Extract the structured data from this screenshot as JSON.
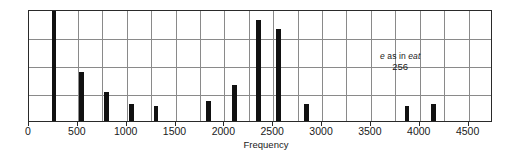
{
  "chart_data": {
    "type": "bar",
    "title": "",
    "subtitle": "",
    "xlabel": "Frequency",
    "ylabel": "",
    "xlim": [
      0,
      4750
    ],
    "ylim": [
      0,
      4
    ],
    "grid": true,
    "legend": null,
    "xticks": [
      0,
      500,
      1000,
      1500,
      2000,
      2500,
      3000,
      3500,
      4000,
      4500
    ],
    "xticklabels": [
      "0",
      "500",
      "1000",
      "1500",
      "2000",
      "2500",
      "3000",
      "3500",
      "4000",
      "4500"
    ],
    "yticks": [
      0,
      1,
      2,
      3,
      4
    ],
    "yticklabels": [
      "",
      "",
      "",
      "",
      ""
    ],
    "x": [
      256,
      540,
      790,
      1050,
      1300,
      1840,
      2100,
      2350,
      2550,
      2840,
      3870,
      4140
    ],
    "values": [
      4.0,
      1.75,
      1.05,
      0.62,
      0.55,
      0.72,
      1.3,
      3.6,
      3.3,
      0.6,
      0.55,
      0.6
    ],
    "bar_width_hz": 50,
    "bars": [
      {
        "name": "bar-256",
        "freq": 256,
        "height": 4.0
      },
      {
        "name": "bar-540",
        "freq": 540,
        "height": 1.75
      },
      {
        "name": "bar-790",
        "freq": 790,
        "height": 1.05
      },
      {
        "name": "bar-1050",
        "freq": 1050,
        "height": 0.62
      },
      {
        "name": "bar-1300",
        "freq": 1300,
        "height": 0.55
      },
      {
        "name": "bar-1840",
        "freq": 1840,
        "height": 0.72
      },
      {
        "name": "bar-2100",
        "freq": 2100,
        "height": 1.3
      },
      {
        "name": "bar-2350",
        "freq": 2350,
        "height": 3.6
      },
      {
        "name": "bar-2550",
        "freq": 2550,
        "height": 3.3
      },
      {
        "name": "bar-2840",
        "freq": 2840,
        "height": 0.6
      },
      {
        "name": "bar-3870",
        "freq": 3870,
        "height": 0.55
      },
      {
        "name": "bar-4140",
        "freq": 4140,
        "height": 0.6
      }
    ],
    "annotations": [
      {
        "name": "vowel-annotation",
        "label_prefix": "e",
        "label_middle": " as in ",
        "label_suffix": "eat",
        "value": "256",
        "at_freq": 3800,
        "at_level": 2.55
      }
    ],
    "colors": {
      "bar": "#111111",
      "grid": "#8a8a8a",
      "frame": "#2a2a2a",
      "text": "#1a1a1a",
      "background": "#ffffff"
    }
  },
  "axis": {
    "x_title": "Frequency"
  }
}
